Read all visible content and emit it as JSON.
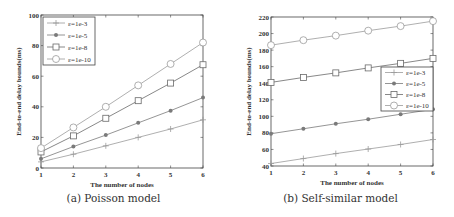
{
  "figures": {
    "a": {
      "caption": "(a) Poisson model"
    },
    "b": {
      "caption": "(b) Self-similar model"
    }
  },
  "chart_data": [
    {
      "type": "line",
      "title": "",
      "caption": "(a) Poisson model",
      "xlabel": "The number of nodes",
      "ylabel": "End-to-end delay bounds(ms)",
      "x": [
        1,
        2,
        3,
        4,
        5,
        6
      ],
      "xlim": [
        1,
        6
      ],
      "ylim": [
        0,
        100
      ],
      "xticks": [
        1,
        2,
        3,
        4,
        5,
        6
      ],
      "yticks": [
        0,
        20,
        40,
        60,
        80,
        100
      ],
      "grid": false,
      "legend_position": "upper left",
      "series": [
        {
          "name": "ε=1e-3",
          "marker": "plus",
          "color": "#9a9a9a",
          "values": [
            4,
            9,
            14.5,
            20,
            25.5,
            31.5
          ]
        },
        {
          "name": "ε=1e-5",
          "marker": "filled-dot",
          "color": "#7a7a7a",
          "values": [
            6,
            14,
            21.5,
            29.5,
            37.5,
            46
          ]
        },
        {
          "name": "ε=1e-8",
          "marker": "square",
          "color": "#6a6a6a",
          "values": [
            10.5,
            21,
            32.5,
            44,
            55.5,
            67.5
          ]
        },
        {
          "name": "ε=1e-10",
          "marker": "circle",
          "color": "#9a9a9a",
          "values": [
            13,
            26.5,
            40,
            54,
            68,
            82
          ]
        }
      ]
    },
    {
      "type": "line",
      "title": "",
      "caption": "(b) Self-similar model",
      "xlabel": "The number of nodes",
      "ylabel": "End-to-end delay bounds(ms)",
      "x": [
        1,
        2,
        3,
        4,
        5,
        6
      ],
      "xlim": [
        1,
        6
      ],
      "ylim": [
        40,
        220
      ],
      "xticks": [
        1,
        2,
        3,
        4,
        5,
        6
      ],
      "yticks": [
        40,
        60,
        80,
        100,
        120,
        140,
        160,
        180,
        200,
        220
      ],
      "grid": false,
      "legend_position": "center right",
      "series": [
        {
          "name": "ε=1e-3",
          "marker": "plus",
          "color": "#9a9a9a",
          "values": [
            43,
            49,
            55,
            60.5,
            66,
            72
          ]
        },
        {
          "name": "ε=1e-5",
          "marker": "filled-dot",
          "color": "#7a7a7a",
          "values": [
            79,
            85,
            91,
            96.5,
            102.5,
            108.5
          ]
        },
        {
          "name": "ε=1e-8",
          "marker": "square",
          "color": "#6a6a6a",
          "values": [
            141,
            147,
            152.5,
            158.5,
            164,
            170
          ]
        },
        {
          "name": "ε=1e-10",
          "marker": "circle",
          "color": "#9a9a9a",
          "values": [
            186,
            192,
            197.5,
            203.5,
            209,
            215
          ]
        }
      ]
    }
  ]
}
